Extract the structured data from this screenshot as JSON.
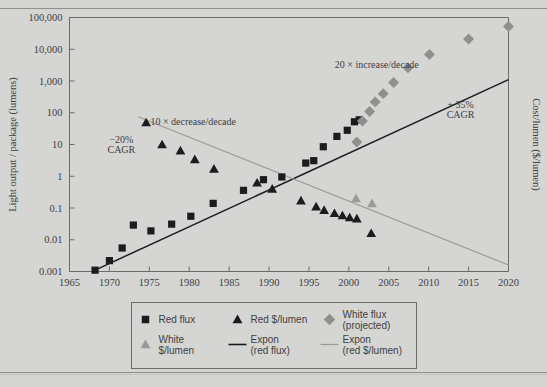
{
  "chart_data": {
    "type": "scatter",
    "title": "",
    "xlabel": "",
    "ylabel": "Light output / package (lumens)",
    "y2label": "Cost/lumen ($/lumen)",
    "xlim": [
      1965,
      2020
    ],
    "ylim": [
      0.001,
      100000
    ],
    "yscale": "log",
    "grid": false,
    "legend_position": "bottom",
    "xticks": [
      "1965",
      "1970",
      "1975",
      "1980",
      "1985",
      "1990",
      "1995",
      "2000",
      "2005",
      "2010",
      "2015",
      "2020"
    ],
    "yticks": [
      "100,000",
      "10,000",
      "1,000",
      "100",
      "10",
      "1",
      "0.1",
      "0.01",
      "0.001"
    ],
    "annotations": [
      {
        "text": "10 × decrease/decade",
        "x": 1980.5,
        "y": 40
      },
      {
        "text": "−20%",
        "x": 1971.5,
        "y": 11
      },
      {
        "text": "CAGR",
        "x": 1971.5,
        "y": 5.5
      },
      {
        "text": "20 × increase/decade",
        "x": 2003.5,
        "y": 2600
      },
      {
        "text": "+ 35%",
        "x": 2014.0,
        "y": 140
      },
      {
        "text": "CAGR",
        "x": 2014.0,
        "y": 70
      }
    ],
    "series": [
      {
        "name": "Red flux",
        "marker": "square",
        "color": "#1c1c1c",
        "points": [
          [
            1968.2,
            0.0011
          ],
          [
            1970.0,
            0.0022
          ],
          [
            1971.6,
            0.0055
          ],
          [
            1973.0,
            0.029
          ],
          [
            1975.2,
            0.019
          ],
          [
            1977.8,
            0.031
          ],
          [
            1980.2,
            0.055
          ],
          [
            1983.0,
            0.14
          ],
          [
            1986.8,
            0.36
          ],
          [
            1989.3,
            0.78
          ],
          [
            1991.6,
            0.95
          ],
          [
            1994.6,
            2.6
          ],
          [
            1995.6,
            3.1
          ],
          [
            1996.8,
            8.5
          ],
          [
            1998.5,
            18
          ],
          [
            1999.8,
            28
          ],
          [
            2000.7,
            52
          ],
          [
            2001.3,
            60
          ]
        ]
      },
      {
        "name": "Red $/lumen",
        "marker": "triangle",
        "color": "#1c1c1c",
        "points": [
          [
            1974.6,
            49
          ],
          [
            1976.6,
            10
          ],
          [
            1978.9,
            6.4
          ],
          [
            1980.7,
            3.4
          ],
          [
            1983.1,
            1.7
          ],
          [
            1988.5,
            0.62
          ],
          [
            1990.4,
            0.4
          ],
          [
            1994.0,
            0.17
          ],
          [
            1995.9,
            0.11
          ],
          [
            1996.9,
            0.085
          ],
          [
            1998.2,
            0.068
          ],
          [
            1999.2,
            0.058
          ],
          [
            2000.1,
            0.05
          ],
          [
            2001.0,
            0.046
          ],
          [
            2002.8,
            0.016
          ]
        ]
      },
      {
        "name": "White $/lumen",
        "marker": "triangle",
        "color": "#9a9a98",
        "points": [
          [
            2000.9,
            0.2
          ],
          [
            2002.9,
            0.14
          ]
        ]
      },
      {
        "name": "White flux (projected)",
        "marker": "diamond",
        "color": "#8f8f8d",
        "points": [
          [
            2001.0,
            12
          ],
          [
            2001.7,
            55
          ],
          [
            2002.6,
            110
          ],
          [
            2003.3,
            220
          ],
          [
            2004.3,
            400
          ],
          [
            2005.6,
            900
          ],
          [
            2007.4,
            2600
          ],
          [
            2010.1,
            6800
          ],
          [
            2015.0,
            21000
          ],
          [
            2020.0,
            52000
          ]
        ]
      }
    ],
    "trendlines": [
      {
        "name": "Expon (red flux)",
        "color": "#1c1c1c",
        "x0": 1968.0,
        "y0": 0.00105,
        "x1": 2020.0,
        "y1": 1100
      },
      {
        "name": "Expon (red $/lumen)",
        "color": "#9a9a98",
        "x0": 1973.6,
        "y0": 75,
        "x1": 2020.0,
        "y1": 0.0016
      }
    ]
  },
  "legend": {
    "items": [
      {
        "label": "Red flux",
        "marker": "square",
        "color": "#1c1c1c"
      },
      {
        "label": "Red $/lumen",
        "marker": "triangle",
        "color": "#1c1c1c"
      },
      {
        "label_line1": "White flux",
        "label_line2": "(projected)",
        "marker": "diamond",
        "color": "#8f8f8d"
      },
      {
        "label_line1": "White",
        "label_line2": "$/lumen",
        "marker": "triangle",
        "color": "#9a9a98"
      },
      {
        "label_line1": "Expon",
        "label_line2": "(red flux)",
        "marker": "line",
        "color": "#1c1c1c"
      },
      {
        "label_line1": "Expon",
        "label_line2": "(red $/lumen)",
        "marker": "line",
        "color": "#9a9a98"
      }
    ]
  },
  "colors": {
    "background": "#d5d5d3",
    "axis": "#6b6b69",
    "dark_marker": "#1c1c1c",
    "gray_marker": "#8f8f8d",
    "light_marker": "#9a9a98",
    "text": "#3f3f3f"
  }
}
